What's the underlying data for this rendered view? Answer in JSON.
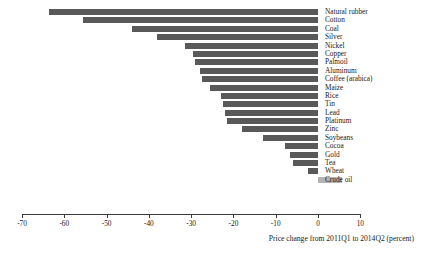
{
  "chart_data": {
    "type": "bar",
    "orientation": "horizontal",
    "title": "",
    "xlabel": "Price change from 2011Q1 to 2014Q2 (percent)",
    "ylabel": "",
    "xlim": [
      -70,
      10
    ],
    "xticks": [
      -70,
      -60,
      -50,
      -40,
      -30,
      -20,
      -10,
      0,
      10
    ],
    "xtick_labels": [
      "-70",
      "-60",
      "-50",
      "-40",
      "-30",
      "-20",
      "-10",
      "0",
      "10"
    ],
    "grid": false,
    "legend": null,
    "categories": [
      "Natural rubber",
      "Cotton",
      "Coal",
      "Silver",
      "Nickel",
      "Copper",
      "Palmoil",
      "Aluminum",
      "Coffee (arabica)",
      "Maize",
      "Rice",
      "Tin",
      "Lead",
      "Platinum",
      "Zinc",
      "Soybeans",
      "Cocoa",
      "Gold",
      "Tea",
      "Wheat",
      "Crude oil"
    ],
    "values": [
      -63.7,
      -55.6,
      -44.0,
      -38.0,
      -31.4,
      -29.5,
      -29.0,
      -28.0,
      -27.5,
      -25.5,
      -23.0,
      -22.5,
      -22.0,
      -21.5,
      -18.0,
      -13.0,
      -7.7,
      -6.7,
      -5.8,
      -2.3,
      5.6
    ]
  },
  "colors": {
    "bar_negative": "#595959",
    "bar_positive": "#b3b3b3",
    "axis": "#3a3a3a",
    "text": "#1a1a1a",
    "background": "#ffffff"
  }
}
